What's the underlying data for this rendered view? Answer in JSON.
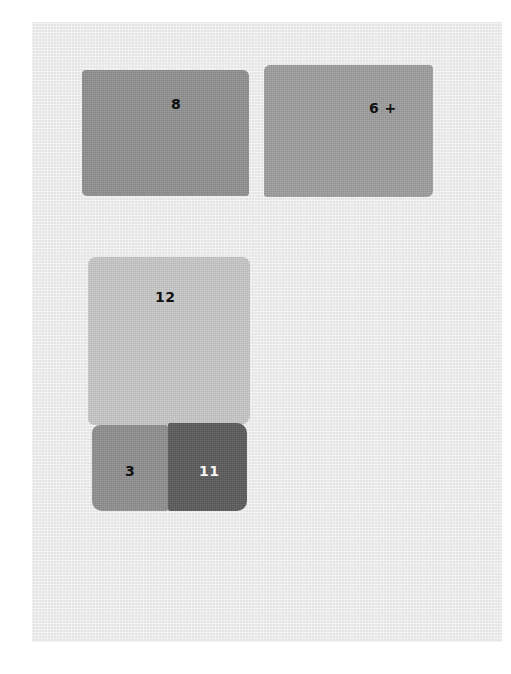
{
  "swatches": [
    {
      "id": "8",
      "label": "8",
      "color": "#8f8f8f",
      "label_color": "#111111"
    },
    {
      "id": "6+",
      "label": "6 +",
      "color": "#9c9c9c",
      "label_color": "#111111"
    },
    {
      "id": "12",
      "label": "12",
      "color": "#c6c6c6",
      "label_color": "#111111"
    },
    {
      "id": "3",
      "label": "3",
      "color": "#8e8e8e",
      "label_color": "#111111"
    },
    {
      "id": "11",
      "label": "11",
      "color": "#5a5a5a",
      "label_color": "#f5f5f5"
    }
  ],
  "colors": {
    "page_background": "#ffffff",
    "canvas_background": "#ededed"
  }
}
